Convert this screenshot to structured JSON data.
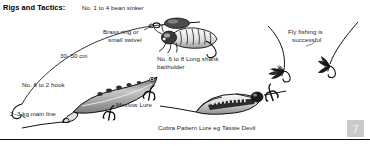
{
  "figure": {
    "title": "Rigs and Tactics:",
    "page_number": "7",
    "line_color": "#111111",
    "label_color": "#1d1d1d",
    "badge_color": "#c9c9c9"
  },
  "labels": {
    "bean_sinker": "No. 1 to 4 bean sinker",
    "brass_ring_1": "Brass ring or",
    "brass_ring_2": "small swivel",
    "leader_length": "30–50 cm",
    "hook_6_to_2": "No. 6 to 2 hook",
    "main_line": "2–3 kg main line",
    "minnow_lure": "Minnow Lure",
    "baitholder_1": "No. 6 to 8 Long shank",
    "baitholder_2": "baitholder",
    "fly_fishing_1": "Fly fishing is",
    "fly_fishing_2": "successful",
    "cobra_lure": "Cobra Pattern Lure eg Tassie Devil"
  },
  "illustrations": [
    {
      "name": "bean-sinker",
      "description": "oval lead bean sinker threaded on line"
    },
    {
      "name": "brass-swivel",
      "description": "small brass ring / swivel on leader"
    },
    {
      "name": "grub-bait",
      "description": "witchetty grub on long shank baitholder hook"
    },
    {
      "name": "baited-hook",
      "description": "long shank baitholder hook"
    },
    {
      "name": "bare-hook",
      "description": "No. 6 to 2 bare fishing hook"
    },
    {
      "name": "minnow-lure",
      "description": "minnow body lure with two treble hooks"
    },
    {
      "name": "cobra-lure",
      "description": "cobra pattern spoon lure eg Tassie Devil with treble"
    },
    {
      "name": "wet-fly",
      "description": "dark hackle wet fly on leader"
    },
    {
      "name": "dry-fly",
      "description": "dry fly on tippet"
    }
  ]
}
